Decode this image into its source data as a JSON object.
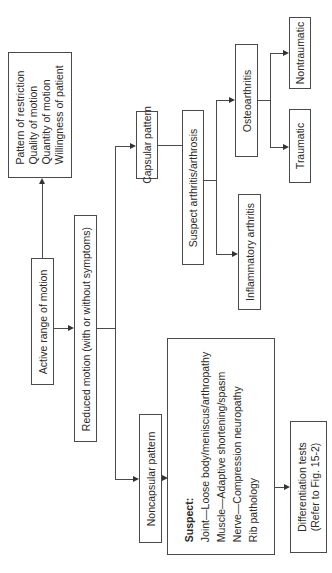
{
  "diagram": {
    "orientation": "rotated 90 degrees counter-clockwise",
    "nodes": {
      "assessment_criteria": {
        "lines": [
          "Pattern of restriction",
          "Quality of motion",
          "Quantity of motion",
          "Willingness of patient"
        ]
      },
      "active_rom": {
        "label": "Active range of motion"
      },
      "reduced_motion": {
        "label": "Reduced motion (with or without symptoms)"
      },
      "capsular": {
        "label": "Capsular pattern"
      },
      "suspect_arthritis": {
        "label": "Suspect arthritis/arthrosis"
      },
      "osteoarthritis": {
        "label": "Osteoarthritis"
      },
      "traumatic": {
        "label": "Traumatic"
      },
      "nontraumatic": {
        "label": "Nontraumatic"
      },
      "inflammatory": {
        "label": "Inflammatory arthritis"
      },
      "noncapsular": {
        "label": "Noncapsular pattern"
      },
      "suspect_list": {
        "heading": "Suspect:",
        "lines": [
          "Joint—Loose body/meniscus/arthropathy",
          "Muscle—Adaptive shortening/spasm",
          "Nerve—Compression neuropathy",
          "Rib pathology"
        ]
      },
      "differentiation": {
        "lines": [
          "Differentiation tests",
          "(Refer to Fig. 15-2)"
        ]
      }
    },
    "edges": [
      [
        "Active range of motion",
        "Pattern of restriction / Quality / Quantity / Willingness"
      ],
      [
        "Active range of motion",
        "Reduced motion (with or without symptoms)"
      ],
      [
        "Reduced motion (with or without symptoms)",
        "Capsular pattern"
      ],
      [
        "Reduced motion (with or without symptoms)",
        "Noncapsular pattern"
      ],
      [
        "Capsular pattern",
        "Suspect arthritis/arthrosis"
      ],
      [
        "Suspect arthritis/arthrosis",
        "Osteoarthritis"
      ],
      [
        "Suspect arthritis/arthrosis",
        "Inflammatory arthritis"
      ],
      [
        "Osteoarthritis",
        "Traumatic"
      ],
      [
        "Osteoarthritis",
        "Nontraumatic"
      ],
      [
        "Noncapsular pattern",
        "Suspect list"
      ],
      [
        "Suspect list",
        "Differentiation tests (Refer to Fig. 15-2)"
      ]
    ]
  }
}
